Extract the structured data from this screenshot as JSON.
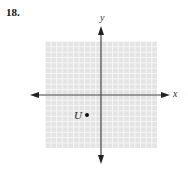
{
  "problem": {
    "number": "18."
  },
  "graph": {
    "x_axis_label": "x",
    "y_axis_label": "y",
    "grid_color": "#e4e4e4",
    "grid_line_color": "#f7f7f7",
    "axis_color": "#444444",
    "grid_units_per_axis": 20
  },
  "points": [
    {
      "label": "U",
      "approx_coords": [
        -3,
        -4
      ]
    }
  ]
}
